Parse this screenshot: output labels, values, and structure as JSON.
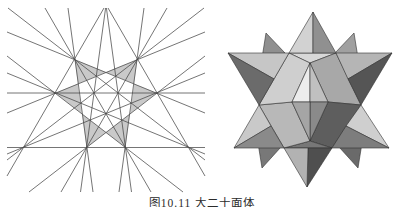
{
  "page": {
    "background": "#ffffff"
  },
  "caption": {
    "text": "图10.11  大二十面体"
  },
  "stellation_diagram": {
    "description": "stellation diagram of the icosahedron, face-plane line arrangement",
    "line_color": "#474747",
    "line_width": 0.75,
    "lines": [
      [
        167,
        8,
        61,
        192
      ],
      [
        45,
        8,
        151,
        192
      ],
      [
        8,
        8,
        205,
        160
      ],
      [
        204,
        8,
        7,
        160
      ],
      [
        205,
        56,
        29,
        192
      ],
      [
        7,
        56,
        183,
        192
      ],
      [
        108,
        8,
        205,
        176
      ],
      [
        104,
        8,
        7,
        176
      ],
      [
        106.4,
        8,
        131.5,
        192
      ],
      [
        105.6,
        8,
        80.5,
        192
      ],
      [
        144,
        8,
        119,
        192
      ],
      [
        68,
        8,
        93,
        192
      ],
      [
        205,
        73,
        7,
        154
      ],
      [
        7,
        73,
        205,
        154
      ],
      [
        7,
        32,
        205,
        113
      ],
      [
        205,
        32,
        7,
        113
      ],
      [
        7,
        147.5,
        205,
        147.5
      ],
      [
        7,
        93,
        205,
        93
      ]
    ],
    "shapes": [
      {
        "name": "shaded-cell-triangle-a",
        "points": [
          [
            137.4,
            59.4
          ],
          [
            125.4,
            147.5
          ],
          [
            55.2,
            93.1
          ]
        ],
        "fill": "#c9c9c9"
      },
      {
        "name": "shaded-cell-triangle-b",
        "points": [
          [
            74.6,
            59.4
          ],
          [
            86.6,
            147.5
          ],
          [
            156.8,
            93.1
          ]
        ],
        "fill": "#c9c9c9"
      },
      {
        "name": "central-white-hexagon",
        "points": [
          [
            106,
            72.3
          ],
          [
            134.1,
            83.8
          ],
          [
            130,
            113.9
          ],
          [
            106,
            132.4
          ],
          [
            82,
            113.9
          ],
          [
            77.9,
            83.8
          ]
        ],
        "fill": "#ffffff"
      }
    ]
  },
  "polyhedron": {
    "description": "great icosahedron solid rendering",
    "edge_color": "#303030",
    "edge_width": 0.6,
    "facets": [
      {
        "points": [
          [
            266,
            33
          ],
          [
            285,
            53
          ],
          [
            262,
            58
          ]
        ],
        "fill": "#8f8f8f"
      },
      {
        "points": [
          [
            354,
            33
          ],
          [
            335,
            53
          ],
          [
            358,
            58
          ]
        ],
        "fill": "#a0a0a0"
      },
      {
        "points": [
          [
            262,
            168
          ],
          [
            281,
            147
          ],
          [
            258,
            143
          ]
        ],
        "fill": "#787878"
      },
      {
        "points": [
          [
            358,
            168
          ],
          [
            339,
            147
          ],
          [
            362,
            143
          ]
        ],
        "fill": "#6a6a6a"
      },
      {
        "points": [
          [
            289,
            53
          ],
          [
            336,
            53
          ],
          [
            310,
            63
          ]
        ],
        "fill": "#d8d8d8"
      },
      {
        "points": [
          [
            336,
            53
          ],
          [
            361,
            105
          ],
          [
            328,
            102
          ],
          [
            310,
            63
          ]
        ],
        "fill": "#a8a8a8"
      },
      {
        "points": [
          [
            361,
            105
          ],
          [
            332,
            148
          ],
          [
            310,
            141
          ],
          [
            328,
            102
          ]
        ],
        "fill": "#5e5e5e"
      },
      {
        "points": [
          [
            332,
            148
          ],
          [
            284,
            148
          ],
          [
            310,
            141
          ]
        ],
        "fill": "#777777"
      },
      {
        "points": [
          [
            284,
            148
          ],
          [
            259,
            105
          ],
          [
            292,
            102
          ],
          [
            310,
            141
          ]
        ],
        "fill": "#b8b8b8"
      },
      {
        "points": [
          [
            259,
            105
          ],
          [
            289,
            53
          ],
          [
            310,
            63
          ],
          [
            292,
            102
          ]
        ],
        "fill": "#cfcfcf"
      },
      {
        "points": [
          [
            310,
            63
          ],
          [
            310,
            102
          ],
          [
            292,
            102
          ]
        ],
        "fill": "#ececec"
      },
      {
        "points": [
          [
            310,
            63
          ],
          [
            328,
            102
          ],
          [
            310,
            102
          ]
        ],
        "fill": "#c0c0c0"
      },
      {
        "points": [
          [
            310,
            102
          ],
          [
            328,
            102
          ],
          [
            310,
            141
          ]
        ],
        "fill": "#8a8a8a"
      },
      {
        "points": [
          [
            310,
            102
          ],
          [
            310,
            141
          ],
          [
            292,
            102
          ]
        ],
        "fill": "#a5a5a5"
      },
      {
        "points": [
          [
            228,
            53
          ],
          [
            289,
            53
          ],
          [
            274,
            79
          ]
        ],
        "fill": "#c6c6c6"
      },
      {
        "points": [
          [
            228,
            53
          ],
          [
            274,
            79
          ],
          [
            259,
            105
          ]
        ],
        "fill": "#6b6b6b"
      },
      {
        "points": [
          [
            313,
            12
          ],
          [
            289,
            53
          ],
          [
            313,
            53
          ]
        ],
        "fill": "#d2d2d2"
      },
      {
        "points": [
          [
            313,
            12
          ],
          [
            313,
            53
          ],
          [
            336,
            53
          ]
        ],
        "fill": "#909090"
      },
      {
        "points": [
          [
            392,
            53
          ],
          [
            336,
            53
          ],
          [
            348,
            79
          ]
        ],
        "fill": "#b5b5b5"
      },
      {
        "points": [
          [
            392,
            53
          ],
          [
            348,
            79
          ],
          [
            361,
            105
          ]
        ],
        "fill": "#555555"
      },
      {
        "points": [
          [
            389,
            148
          ],
          [
            361,
            105
          ],
          [
            346,
            126
          ]
        ],
        "fill": "#cfcfcf"
      },
      {
        "points": [
          [
            389,
            148
          ],
          [
            346,
            126
          ],
          [
            332,
            148
          ]
        ],
        "fill": "#7d7d7d"
      },
      {
        "points": [
          [
            307,
            187
          ],
          [
            332,
            148
          ],
          [
            308,
            148
          ]
        ],
        "fill": "#4f4f4f"
      },
      {
        "points": [
          [
            307,
            187
          ],
          [
            308,
            148
          ],
          [
            284,
            148
          ]
        ],
        "fill": "#b2b2b2"
      },
      {
        "points": [
          [
            234,
            148
          ],
          [
            259,
            105
          ],
          [
            271,
            126
          ]
        ],
        "fill": "#c9c9c9"
      },
      {
        "points": [
          [
            234,
            148
          ],
          [
            271,
            126
          ],
          [
            284,
            148
          ]
        ],
        "fill": "#8a8a8a"
      }
    ]
  }
}
